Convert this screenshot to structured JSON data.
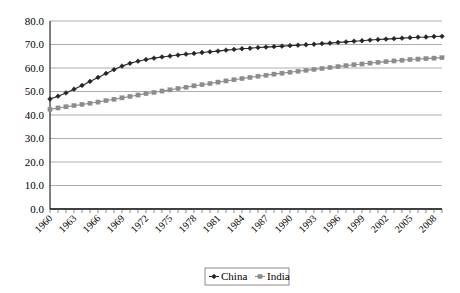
{
  "chart_data": {
    "type": "line",
    "title": "",
    "subtitle": "",
    "xlabel": "",
    "ylabel": "",
    "ylim": [
      0.0,
      80.0
    ],
    "ytick_labels": [
      "0.0",
      "10.0",
      "20.0",
      "30.0",
      "40.0",
      "50.0",
      "60.0",
      "70.0",
      "80.0"
    ],
    "ytick_values": [
      0,
      10,
      20,
      30,
      40,
      50,
      60,
      70,
      80
    ],
    "grid": true,
    "grid_axis": "y",
    "legend_position": "bottom-center",
    "x": [
      1960,
      1961,
      1962,
      1963,
      1964,
      1965,
      1966,
      1967,
      1968,
      1969,
      1970,
      1971,
      1972,
      1973,
      1974,
      1975,
      1976,
      1977,
      1978,
      1979,
      1980,
      1981,
      1982,
      1983,
      1984,
      1985,
      1986,
      1987,
      1988,
      1989,
      1990,
      1991,
      1992,
      1993,
      1994,
      1995,
      1996,
      1997,
      1998,
      1999,
      2000,
      2001,
      2002,
      2003,
      2004,
      2005,
      2006,
      2007,
      2008,
      2009
    ],
    "xtick_labels": [
      "1960",
      "1963",
      "1966",
      "1969",
      "1972",
      "1975",
      "1978",
      "1981",
      "1984",
      "1987",
      "1990",
      "1993",
      "1996",
      "1999",
      "2002",
      "2005",
      "2008"
    ],
    "xtick_values": [
      1960,
      1963,
      1966,
      1969,
      1972,
      1975,
      1978,
      1981,
      1984,
      1987,
      1990,
      1993,
      1996,
      1999,
      2002,
      2005,
      2008
    ],
    "series": [
      {
        "name": "China",
        "color": "#262626",
        "marker": "diamond",
        "values": [
          46.8,
          48.0,
          49.4,
          51.0,
          52.6,
          54.3,
          56.0,
          57.7,
          59.3,
          60.8,
          62.0,
          62.9,
          63.6,
          64.2,
          64.7,
          65.1,
          65.5,
          65.9,
          66.2,
          66.6,
          66.9,
          67.2,
          67.6,
          67.9,
          68.2,
          68.4,
          68.7,
          68.9,
          69.1,
          69.3,
          69.5,
          69.7,
          69.9,
          70.1,
          70.4,
          70.6,
          70.9,
          71.1,
          71.4,
          71.6,
          71.9,
          72.1,
          72.3,
          72.5,
          72.7,
          72.9,
          73.1,
          73.2,
          73.4,
          73.5
        ]
      },
      {
        "name": "India",
        "color": "#8c8c8c",
        "marker": "square",
        "values": [
          42.4,
          43.0,
          43.5,
          44.0,
          44.5,
          45.0,
          45.5,
          46.1,
          46.7,
          47.3,
          47.9,
          48.5,
          49.1,
          49.6,
          50.2,
          50.7,
          51.3,
          51.8,
          52.4,
          52.9,
          53.4,
          54.0,
          54.5,
          55.0,
          55.5,
          56.0,
          56.5,
          56.9,
          57.4,
          57.8,
          58.2,
          58.6,
          59.0,
          59.4,
          59.8,
          60.2,
          60.6,
          61.0,
          61.4,
          61.7,
          62.1,
          62.4,
          62.7,
          63.0,
          63.3,
          63.6,
          63.8,
          64.0,
          64.2,
          64.4
        ]
      }
    ],
    "legend": [
      {
        "label": "China",
        "color": "#262626",
        "marker": "diamond"
      },
      {
        "label": "India",
        "color": "#8c8c8c",
        "marker": "square"
      }
    ]
  }
}
